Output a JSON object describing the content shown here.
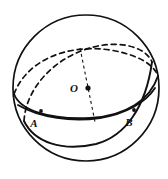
{
  "figure": {
    "type": "sphere-geometry-diagram",
    "background_color": "#ffffff",
    "stroke_color": "#111111",
    "sphere": {
      "name": "sphere-outline",
      "center_x": 86,
      "center_y": 88,
      "radius": 73,
      "stroke_width": 1.7
    },
    "center_point": {
      "label": "O",
      "dot_x": 88,
      "dot_y": 88,
      "label_x": 74,
      "label_y": 92,
      "dot_radius": 2.6
    },
    "points": [
      {
        "label": "A",
        "dot_x": 41,
        "dot_y": 111,
        "label_x": 34,
        "label_y": 127,
        "dot_radius": 1.9
      },
      {
        "label": "B",
        "dot_x": 134,
        "dot_y": 110,
        "label_x": 129,
        "label_y": 126,
        "dot_radius": 1.9
      }
    ],
    "axis_line": {
      "name": "center-axis-dashed-line",
      "x1": 80,
      "y1": 48,
      "x2": 95,
      "y2": 122,
      "dash": "3 3"
    },
    "great_circles": [
      {
        "name": "equator-ellipse",
        "front_solid": true,
        "back_dashed": true
      },
      {
        "name": "tilted-great-circle-ellipse",
        "front_solid": true,
        "back_dashed": true
      }
    ],
    "crossings": {
      "upper_dashed_crossing_x": 82,
      "upper_dashed_crossing_y": 58,
      "lower_solid_crossing_x": 95,
      "lower_solid_crossing_y": 117
    }
  }
}
